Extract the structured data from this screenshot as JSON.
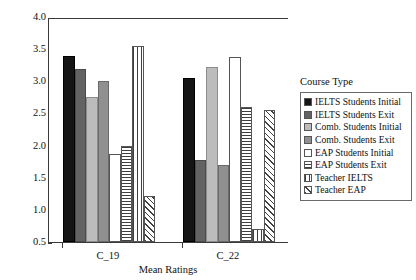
{
  "chart_data": {
    "type": "bar",
    "title": "",
    "xlabel": "Mean Ratings",
    "ylabel": "",
    "categories": [
      "C_19",
      "C_22"
    ],
    "ylim": [
      0.5,
      4.0
    ],
    "yticks": [
      "0.5",
      "1.0",
      "1.5",
      "2.0",
      "2.5",
      "3.0",
      "3.5",
      "4.0"
    ],
    "ytick_values": [
      0.5,
      1.0,
      1.5,
      2.0,
      2.5,
      3.0,
      3.5,
      4.0
    ],
    "grid": false,
    "legend_position": "right",
    "legend_title": "Course Type",
    "series": [
      {
        "name": "IELTS Students Initial",
        "pattern": "solid-black",
        "values": [
          3.4,
          3.05
        ]
      },
      {
        "name": "IELTS Students Exit",
        "pattern": "solid-dark-gray",
        "values": [
          3.19,
          1.77
        ]
      },
      {
        "name": "Comb. Students Initial",
        "pattern": "solid-light-gray",
        "values": [
          2.75,
          3.22
        ]
      },
      {
        "name": "Comb. Students Exit",
        "pattern": "solid-med-gray",
        "values": [
          3.0,
          1.7
        ]
      },
      {
        "name": "EAP Students Initial",
        "pattern": "white",
        "values": [
          1.87,
          3.38
        ]
      },
      {
        "name": "EAP Students Exit",
        "pattern": "horizontal-lines",
        "values": [
          2.0,
          2.6
        ]
      },
      {
        "name": "Teacher IELTS",
        "pattern": "vertical-lines",
        "values": [
          3.55,
          0.7
        ]
      },
      {
        "name": "Teacher EAP",
        "pattern": "diagonal-hatch",
        "values": [
          1.22,
          2.55
        ]
      }
    ]
  },
  "colors": {
    "axis": "#3a3a3a",
    "black": "#151515",
    "dark_gray": "#636363",
    "light_gray": "#bcbcbc",
    "med_gray": "#909090",
    "white": "#ffffff",
    "pattern_ink": "#3f3f3f"
  }
}
